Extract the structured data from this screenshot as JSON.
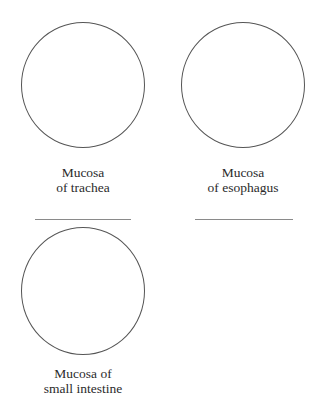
{
  "figure": {
    "panels": [
      {
        "label_line1": "Mucosa",
        "label_line2": "of trachea",
        "answer_blank": ""
      },
      {
        "label_line1": "Mucosa",
        "label_line2": "of esophagus",
        "answer_blank": ""
      },
      {
        "label_line1": "Mucosa of",
        "label_line2": "small intestine"
      }
    ]
  }
}
